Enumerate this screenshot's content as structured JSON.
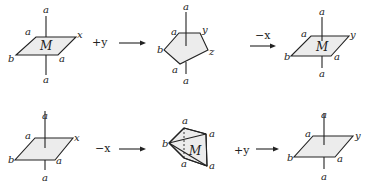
{
  "diagram": {
    "rows": [
      {
        "steps": [
          {
            "shape": "parallelogram",
            "center_label": "M",
            "labels": {
              "top": "a",
              "bottom": "a",
              "upper_left": "a",
              "upper_right": "x",
              "lower_left": "b",
              "lower_right": "a"
            }
          },
          {
            "operation": "+y"
          },
          {
            "shape": "pentagon",
            "labels": {
              "top": "a",
              "bottom": "a",
              "upper_left": "a",
              "upper_right": "y",
              "right": "z",
              "left": "b",
              "lower_left": "a"
            }
          },
          {
            "operation": "−x"
          },
          {
            "shape": "parallelogram",
            "center_label": "M",
            "labels": {
              "top": "a",
              "bottom": "a",
              "upper_left": "a",
              "upper_right": "y",
              "lower_left": "b",
              "lower_right": "a"
            }
          }
        ]
      },
      {
        "steps": [
          {
            "shape": "parallelogram",
            "labels": {
              "top": "a",
              "bottom": "a",
              "upper_left": "a",
              "upper_right": "x",
              "lower_left": "b",
              "lower_right": "a"
            }
          },
          {
            "operation": "−x"
          },
          {
            "shape": "pyramid",
            "center_label": "M",
            "labels": {
              "top": "a",
              "upper_right": "a",
              "left": "b",
              "lower_left": "a",
              "lower_right": "a"
            }
          },
          {
            "operation": "+y"
          },
          {
            "shape": "parallelogram",
            "labels": {
              "top": "a",
              "bottom": "a",
              "upper_left": "a",
              "upper_right": "y",
              "lower_left": "b",
              "lower_right": "a"
            }
          }
        ]
      }
    ]
  }
}
